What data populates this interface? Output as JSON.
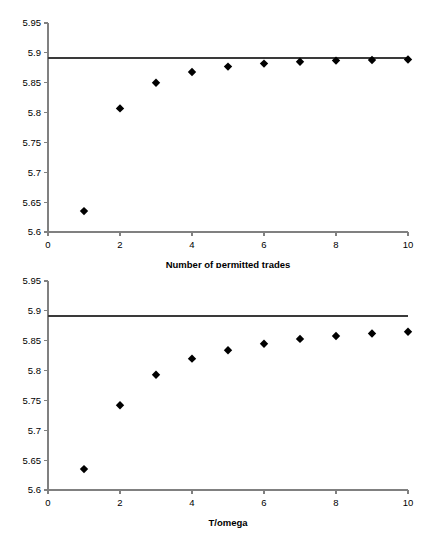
{
  "figure": {
    "background_color": "#ffffff",
    "marker_color": "#000000",
    "axis_color": "#808080",
    "reference_line_color": "#3a3a3a"
  },
  "chart_data": [
    {
      "id": "top",
      "type": "scatter",
      "title": "",
      "xlabel": "Number of permitted trades",
      "ylabel": "",
      "xlim": [
        0,
        10
      ],
      "ylim": [
        5.6,
        5.95
      ],
      "xticks": [
        0,
        2,
        4,
        6,
        8,
        10
      ],
      "xtick_labels": [
        "0",
        "2",
        "4",
        "6",
        "8",
        "10"
      ],
      "yticks": [
        5.6,
        5.65,
        5.7,
        5.75,
        5.8,
        5.85,
        5.9,
        5.95
      ],
      "ytick_labels": [
        "5.6",
        "5.65",
        "5.7",
        "5.75",
        "5.8",
        "5.85",
        "5.9",
        "5.95"
      ],
      "grid": false,
      "legend": "none",
      "x": [
        1,
        2,
        3,
        4,
        5,
        6,
        7,
        8,
        9,
        10
      ],
      "values": [
        5.635,
        5.807,
        5.85,
        5.868,
        5.877,
        5.882,
        5.885,
        5.887,
        5.888,
        5.889
      ],
      "series": [
        {
          "name": "Expected utility by permitted trades",
          "marker": "diamond",
          "values": [
            5.635,
            5.807,
            5.85,
            5.868,
            5.877,
            5.882,
            5.885,
            5.887,
            5.888,
            5.889
          ]
        }
      ],
      "annotations": [
        {
          "type": "hline",
          "name": "upper-bound-reference-line",
          "y": 5.892,
          "label": ""
        }
      ]
    },
    {
      "id": "bottom",
      "type": "scatter",
      "title": "",
      "xlabel": "T/omega",
      "ylabel": "",
      "xlim": [
        0,
        10
      ],
      "ylim": [
        5.6,
        5.95
      ],
      "xticks": [
        0,
        2,
        4,
        6,
        8,
        10
      ],
      "xtick_labels": [
        "0",
        "2",
        "4",
        "6",
        "8",
        "10"
      ],
      "yticks": [
        5.6,
        5.65,
        5.7,
        5.75,
        5.8,
        5.85,
        5.9,
        5.95
      ],
      "ytick_labels": [
        "5.6",
        "5.65",
        "5.7",
        "5.75",
        "5.8",
        "5.85",
        "5.9",
        "5.95"
      ],
      "grid": false,
      "legend": "none",
      "x": [
        1,
        2,
        3,
        4,
        5,
        6,
        7,
        8,
        9,
        10
      ],
      "values": [
        5.635,
        5.742,
        5.793,
        5.82,
        5.834,
        5.845,
        5.853,
        5.858,
        5.862,
        5.865
      ],
      "series": [
        {
          "name": "Expected utility by T/omega",
          "marker": "diamond",
          "values": [
            5.635,
            5.742,
            5.793,
            5.82,
            5.834,
            5.845,
            5.853,
            5.858,
            5.862,
            5.865
          ]
        }
      ],
      "annotations": [
        {
          "type": "hline",
          "name": "upper-bound-reference-line",
          "y": 5.892,
          "label": ""
        }
      ]
    }
  ]
}
